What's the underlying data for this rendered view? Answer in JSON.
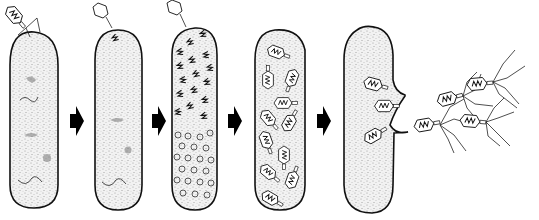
{
  "figure": {
    "title": "",
    "stages": [
      {
        "id": 1,
        "name": "attachment-and-injection",
        "label": ""
      },
      {
        "id": 2,
        "name": "phage-dna-inside-host",
        "label": ""
      },
      {
        "id": 3,
        "name": "phage-dna-replication",
        "label": ""
      },
      {
        "id": 4,
        "name": "phage-assembly",
        "label": ""
      },
      {
        "id": 5,
        "name": "lysis-and-release",
        "label": ""
      }
    ],
    "arrows": 4,
    "colors": {
      "ink": "#111111",
      "background": "#ffffff",
      "stipple": "#9a9a9a"
    }
  }
}
